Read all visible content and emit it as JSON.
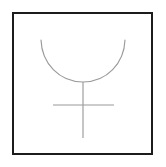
{
  "image": {
    "title": "Line drawing of a bowl-shaped arc above a cross",
    "background_color": "#ffffff",
    "width": 166,
    "height": 167
  },
  "frame": {
    "name": "drawing-border",
    "color": "#1c1c1c",
    "thickness": 2,
    "left": 12,
    "top": 12,
    "width": 141,
    "height": 143
  },
  "figure": {
    "stroke_color": "#9a9a9a",
    "stroke_width": 1.15,
    "arc": {
      "label": "bowl-arc",
      "left_endpoint_x": 41,
      "left_endpoint_y": 40,
      "right_endpoint_x": 125,
      "right_endpoint_y": 40,
      "bottom_x": 83,
      "bottom_y": 82
    },
    "cross": {
      "label": "cross",
      "vertical_x": 83,
      "vertical_top_y": 82,
      "vertical_bottom_y": 138,
      "horizontal_y": 105,
      "horizontal_left_x": 53,
      "horizontal_right_x": 114
    }
  },
  "caption": {
    "text": ""
  }
}
